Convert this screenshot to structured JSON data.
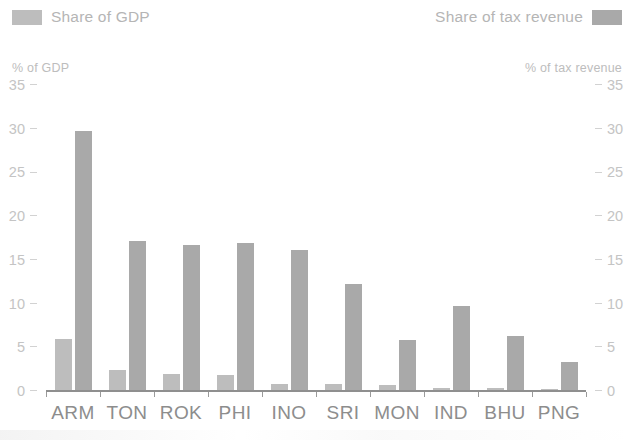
{
  "legend": {
    "left": {
      "label": "Share of GDP",
      "swatch_color": "#bdbdbd",
      "icon": "legend-swatch"
    },
    "right": {
      "label": "Share of tax revenue",
      "swatch_color": "#a9a9a9",
      "icon": "legend-swatch"
    }
  },
  "axes": {
    "left_title": "% of GDP",
    "right_title": "% of tax revenue",
    "ticks": [
      "35",
      "30",
      "25",
      "20",
      "15",
      "10",
      "5",
      "0"
    ]
  },
  "chart_data": {
    "type": "bar",
    "title": "",
    "xlabel": "",
    "ylabel": "% of GDP",
    "y2label": "% of tax revenue",
    "ylim": [
      0,
      35
    ],
    "y2lim": [
      0,
      35
    ],
    "yticks": [
      0,
      5,
      10,
      15,
      20,
      25,
      30,
      35
    ],
    "grid": false,
    "legend_position": "top",
    "categories": [
      "ARM",
      "TON",
      "ROK",
      "PHI",
      "INO",
      "SRI",
      "MON",
      "IND",
      "BHU",
      "PNG"
    ],
    "series": [
      {
        "name": "Share of GDP",
        "axis": "left",
        "color": "#bdbdbd",
        "values": [
          6.1,
          2.5,
          2.1,
          1.9,
          0.9,
          0.9,
          0.8,
          0.5,
          0.45,
          0.3
        ]
      },
      {
        "name": "Share of tax revenue",
        "axis": "right",
        "color": "#a9a9a9",
        "values": [
          29.9,
          17.3,
          16.8,
          17.1,
          16.2,
          12.3,
          6.0,
          9.8,
          6.4,
          3.4
        ]
      }
    ]
  }
}
